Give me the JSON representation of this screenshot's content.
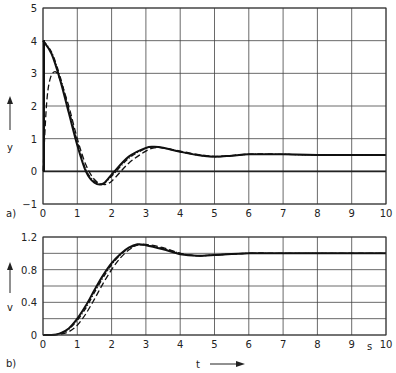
{
  "chart_data": [
    {
      "panel": "a)",
      "type": "line",
      "ylabel": "y",
      "xlabel": "",
      "xlim": [
        0,
        10
      ],
      "ylim": [
        -1,
        5
      ],
      "x_ticks": [
        "0",
        "1",
        "2",
        "3",
        "4",
        "5",
        "6",
        "7",
        "8",
        "9",
        "10"
      ],
      "y_ticks": [
        "-1",
        "0",
        "1",
        "2",
        "3",
        "4",
        "5"
      ],
      "grid": true,
      "series": [
        {
          "name": "solid",
          "x": [
            0,
            0.25,
            0.5,
            0.75,
            1.0,
            1.25,
            1.5,
            1.75,
            2.0,
            2.5,
            3.0,
            3.25,
            3.5,
            4.0,
            4.5,
            5.0,
            5.5,
            6.0,
            7.0,
            8.0,
            10.0
          ],
          "values": [
            4.0,
            3.6,
            2.8,
            1.8,
            0.8,
            0.0,
            -0.35,
            -0.38,
            -0.1,
            0.45,
            0.72,
            0.75,
            0.72,
            0.6,
            0.5,
            0.45,
            0.48,
            0.52,
            0.52,
            0.5,
            0.5
          ]
        },
        {
          "name": "dash-dot",
          "x": [
            0,
            0.25,
            0.5,
            0.75,
            1.0,
            1.25,
            1.5,
            1.75,
            2.0,
            2.5,
            3.0,
            3.25,
            3.5,
            4.0,
            4.5,
            5.0,
            5.5,
            6.0,
            7.0,
            8.0,
            10.0
          ],
          "values": [
            4.0,
            3.65,
            2.9,
            1.9,
            0.9,
            0.05,
            -0.3,
            -0.38,
            -0.15,
            0.4,
            0.7,
            0.75,
            0.72,
            0.6,
            0.5,
            0.45,
            0.48,
            0.52,
            0.52,
            0.5,
            0.5
          ]
        },
        {
          "name": "dashed",
          "x": [
            0,
            0.1,
            0.2,
            0.35,
            0.5,
            0.75,
            1.0,
            1.25,
            1.5,
            1.75,
            2.0,
            2.5,
            3.0,
            3.25,
            3.5,
            4.0,
            4.5,
            5.0,
            5.5,
            6.0,
            7.0,
            8.0,
            10.0
          ],
          "values": [
            0,
            2.0,
            2.8,
            3.05,
            2.8,
            2.0,
            1.0,
            0.2,
            -0.25,
            -0.4,
            -0.3,
            0.25,
            0.62,
            0.72,
            0.72,
            0.62,
            0.52,
            0.46,
            0.48,
            0.52,
            0.52,
            0.5,
            0.5
          ]
        }
      ]
    },
    {
      "panel": "b)",
      "type": "line",
      "ylabel": "v",
      "xlabel": "t",
      "x_unit": "s",
      "xlim": [
        0,
        10
      ],
      "ylim": [
        0,
        1.2
      ],
      "x_ticks": [
        "0",
        "1",
        "2",
        "3",
        "4",
        "5",
        "6",
        "7",
        "8",
        "9",
        "10"
      ],
      "y_ticks": [
        "0",
        "0.4",
        "0.8",
        "1.2"
      ],
      "grid": true,
      "series": [
        {
          "name": "solid",
          "x": [
            0,
            0.25,
            0.5,
            0.75,
            1.0,
            1.25,
            1.5,
            1.75,
            2.0,
            2.25,
            2.5,
            2.75,
            3.0,
            3.5,
            4.0,
            4.5,
            5.0,
            6.0,
            7.0,
            10.0
          ],
          "values": [
            0,
            0,
            0.02,
            0.08,
            0.2,
            0.36,
            0.55,
            0.73,
            0.88,
            0.99,
            1.07,
            1.11,
            1.1,
            1.05,
            0.99,
            0.97,
            0.98,
            1.0,
            1.0,
            1.0
          ]
        },
        {
          "name": "dash-dot",
          "x": [
            0,
            0.25,
            0.5,
            0.75,
            1.0,
            1.25,
            1.5,
            1.75,
            2.0,
            2.25,
            2.5,
            2.75,
            3.0,
            3.5,
            4.0,
            4.5,
            5.0,
            6.0,
            7.0,
            10.0
          ],
          "values": [
            0,
            0,
            0.02,
            0.07,
            0.18,
            0.33,
            0.52,
            0.7,
            0.86,
            0.98,
            1.06,
            1.1,
            1.1,
            1.06,
            1.0,
            0.97,
            0.98,
            1.0,
            1.0,
            1.0
          ]
        },
        {
          "name": "dashed",
          "x": [
            0,
            0.25,
            0.5,
            0.75,
            1.0,
            1.25,
            1.5,
            1.75,
            2.0,
            2.25,
            2.5,
            2.75,
            3.0,
            3.5,
            4.0,
            4.5,
            5.0,
            6.0,
            7.0,
            10.0
          ],
          "values": [
            0,
            0,
            0.01,
            0.04,
            0.12,
            0.26,
            0.44,
            0.63,
            0.8,
            0.94,
            1.04,
            1.1,
            1.11,
            1.07,
            1.0,
            0.97,
            0.98,
            1.0,
            1.0,
            1.0
          ]
        }
      ]
    }
  ],
  "labels": {
    "panel_a": "a)",
    "panel_b": "b)",
    "y_axis_a": "y",
    "y_axis_b": "v",
    "x_axis": "t",
    "x_unit": "s"
  }
}
